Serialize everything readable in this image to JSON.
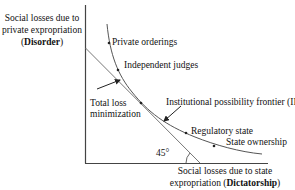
{
  "diagram": {
    "y_axis_label": {
      "line1": "Social losses due to",
      "line2": "private expropriation",
      "open": "(",
      "bold": "Disorder",
      "close": ")"
    },
    "x_axis_label": {
      "line1": "Social losses due to state",
      "line2_prefix": "expropriation (",
      "bold": "Dictatorship",
      "close": ")"
    },
    "curve_points": [
      {
        "label": "Private orderings"
      },
      {
        "label": "Independent judges"
      },
      {
        "label": "Regulatory state"
      },
      {
        "label": "State ownership"
      }
    ],
    "annotations": {
      "total_loss": [
        "Total loss",
        "minimization"
      ],
      "ipf": "Institutional possibility frontier (IPF)",
      "angle": "45°"
    },
    "colors": {
      "axis": "#555555",
      "curve": "#555555",
      "line": "#777777",
      "text": "#111111"
    }
  }
}
